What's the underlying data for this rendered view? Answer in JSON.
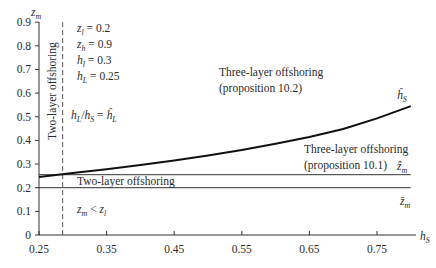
{
  "chart_data": {
    "type": "line",
    "title": "",
    "xlabel": "h_S",
    "ylabel": "z_m",
    "xlim": [
      0.25,
      0.8
    ],
    "ylim": [
      0,
      0.9
    ],
    "x_ticks": [
      "0.25",
      "0.35",
      "0.45",
      "0.55",
      "0.65",
      "0.75"
    ],
    "y_ticks": [
      "0",
      "0.1",
      "0.2",
      "0.3",
      "0.4",
      "0.5",
      "0.6",
      "0.7",
      "0.8",
      "0.9"
    ],
    "grid": false,
    "series": [
      {
        "name": "ĥ_S",
        "style": "solid-thick",
        "x": [
          0.25,
          0.3,
          0.35,
          0.4,
          0.45,
          0.5,
          0.55,
          0.6,
          0.65,
          0.7,
          0.75,
          0.8
        ],
        "y": [
          0.245,
          0.262,
          0.278,
          0.296,
          0.315,
          0.336,
          0.36,
          0.386,
          0.415,
          0.448,
          0.493,
          0.545
        ]
      },
      {
        "name": "ẑ_m",
        "style": "solid-thin",
        "x": [
          0.25,
          0.8
        ],
        "y": [
          0.255,
          0.255
        ]
      },
      {
        "name": "z̄_m",
        "style": "solid-thin",
        "x": [
          0.25,
          0.8
        ],
        "y": [
          0.2,
          0.2
        ]
      },
      {
        "name": "h_L/h_S = ĥ_L",
        "style": "dashed-vertical",
        "x": [
          0.285,
          0.285
        ],
        "y": [
          0,
          0.9
        ]
      }
    ],
    "parameters": [
      "z_l = 0.2",
      "z_h = 0.9",
      "h_l = 0.3",
      "h_L = 0.25"
    ],
    "annotations": [
      "Two-layer offshoring (vertical, left region)",
      "h_L/h_S = ĥ_L",
      "Three-layer offshoring (proposition 10.2)",
      "Three-layer offshoring (proposition 10.1)",
      "Two-layer offshoring",
      "z_m < z_l",
      "ĥ_S",
      "ẑ_m",
      "z̄_m"
    ]
  },
  "labels": {
    "y_axis_var": "z",
    "y_axis_sub": "m",
    "x_axis_var": "h",
    "x_axis_sub": "S",
    "params": [
      {
        "var": "z",
        "sub": "l",
        "val": " = 0.2"
      },
      {
        "var": "z",
        "sub": "h",
        "val": " = 0.9"
      },
      {
        "var": "h",
        "sub": "l",
        "val": " = 0.3"
      },
      {
        "var": "h",
        "sub": "L",
        "val": " = 0.25"
      }
    ],
    "two_layer_vertical": "Two-layer offshoring",
    "ratio_lhs_var": "h",
    "ratio_lhs_sub": "L",
    "ratio_slash": "/",
    "ratio_den_var": "h",
    "ratio_den_sub": "S",
    "ratio_eq": " = ",
    "ratio_rhs_var": "ĥ",
    "ratio_rhs_sub": "L",
    "three_layer_102_line1": "Three-layer offshoring",
    "three_layer_102_line2": "(proposition 10.2)",
    "three_layer_101_line1": "Three-layer offshoring",
    "three_layer_101_line2": "(proposition 10.1)",
    "two_layer_mid": "Two-layer offshoring",
    "zm_less_var": "z",
    "zm_less_sub": "m",
    "zm_less_op": " < ",
    "zm_less_var2": "z",
    "zm_less_sub2": "l",
    "curve_label_var": "ĥ",
    "curve_label_sub": "S",
    "zhat_var": "ẑ",
    "zhat_sub": "m",
    "zbar_var": "z̄",
    "zbar_sub": "m"
  }
}
